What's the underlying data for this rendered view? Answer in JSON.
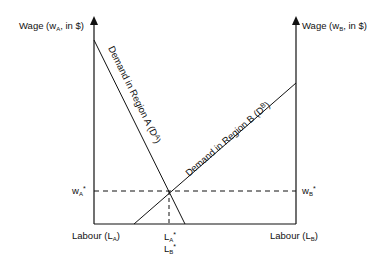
{
  "diagram": {
    "left_axis_label": {
      "prefix": "Wage (w",
      "sub": "A",
      "suffix": ", in $)"
    },
    "right_axis_label": {
      "prefix": "Wage (w",
      "sub": "B",
      "suffix": ", in $)"
    },
    "bottom_left_label": {
      "prefix": "Labour (L",
      "sub": "A",
      "suffix": ")"
    },
    "bottom_right_label": {
      "prefix": "Labour (L",
      "sub": "B",
      "suffix": ")"
    },
    "demand_a_label": {
      "text": "Demand in Region A (D",
      "sup": "A",
      "suffix": ")"
    },
    "demand_b_label": {
      "text": "Demand in Region B (D",
      "sup": "B",
      "suffix": ")"
    },
    "equilibrium_wage_a": {
      "base": "w",
      "sub": "A",
      "sup": "*"
    },
    "equilibrium_wage_b": {
      "base": "w",
      "sub": "B",
      "sup": "*"
    },
    "equilibrium_labour_a": {
      "base": "L",
      "sub": "A",
      "sup": "*"
    },
    "equilibrium_labour_b": {
      "base": "L",
      "sub": "B",
      "sup": "*"
    },
    "line_color": "#111111"
  }
}
